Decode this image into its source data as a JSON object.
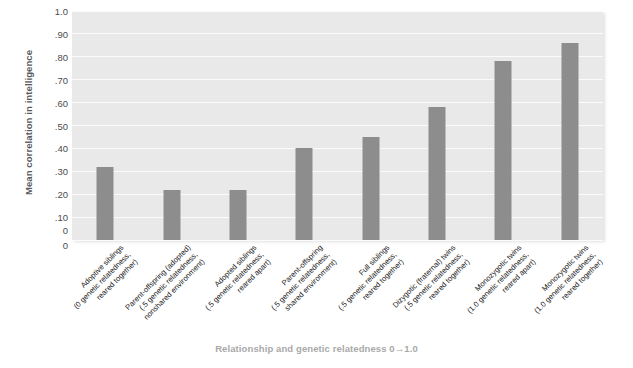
{
  "chart_data": {
    "type": "bar",
    "title": "",
    "xlabel": "Relationship and genetic relatedness 0→1.0",
    "ylabel": "Mean correlation in intelligence",
    "ylim": [
      0,
      1.0
    ],
    "grid": true,
    "legend": "none",
    "bar_color": "#8d8d8d",
    "plot_background": "#e9e9e9",
    "gridline_color": "#fbfbfb",
    "ytick_labels": [
      "0",
      "0",
      ".10",
      ".20",
      ".30",
      ".40",
      ".50",
      ".60",
      ".70",
      ".80",
      ".90",
      "1.0"
    ],
    "ytick_values": [
      0,
      0,
      0.1,
      0.2,
      0.3,
      0.4,
      0.5,
      0.6,
      0.7,
      0.8,
      0.9,
      1.0
    ],
    "categories": [
      "Adoptive siblings (0 genetic relatedness, reared together)",
      "Parent-offspring (adopted) (.5 genetic relatedness, nonshared environment)",
      "Adopted siblings (.5 genetic relatedness, reared apart)",
      "Parent-offspring (.5 genetic relatedness, shared environment)",
      "Full siblings (.5 genetic relatedness, reared together)",
      "Dizygotic (fraternal) twins (.5 genetic relatedness, reared together)",
      "Monozygotic twins (1.0 genetic relatedness, reared apart)",
      "Monozygotic twins (1.0 genetic relatedness, reared together)"
    ],
    "category_lines": [
      [
        "Adoptive siblings",
        "(0 genetic relatedness,",
        "reared together)"
      ],
      [
        "Parent-offspring (adopted)",
        "(.5 genetic relatedness,",
        "nonshared environment)"
      ],
      [
        "Adopted siblings",
        "(.5 genetic relatedness,",
        "reared apart)"
      ],
      [
        "Parent-offspring",
        "(.5 genetic relatedness,",
        "shared environment)"
      ],
      [
        "Full siblings",
        "(.5 genetic relatedness,",
        "reared together)"
      ],
      [
        "Dizygotic (fraternal) twins",
        "(.5 genetic relatedness,",
        "reared together)"
      ],
      [
        "Monozygotic twins",
        "(1.0 genetic relatedness,",
        "reared apart)"
      ],
      [
        "Monozygotic twins",
        "(1.0 genetic relatedness,",
        "reared together)"
      ]
    ],
    "values": [
      0.32,
      0.22,
      0.22,
      0.4,
      0.45,
      0.58,
      0.78,
      0.86
    ]
  }
}
